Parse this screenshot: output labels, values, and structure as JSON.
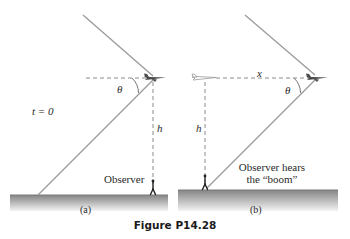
{
  "figure": {
    "caption": "Figure P14.28",
    "colors": {
      "line": "#9a9a9a",
      "dashed": "#8a8a8a",
      "ground_top": "#8c8c8c",
      "ground_bottom": "#f2f2f2",
      "text": "#2a2a2a"
    },
    "panel_a": {
      "label": "(a)",
      "time_label": "t = 0",
      "angle_label": "θ",
      "height_label": "h",
      "observer_label": "Observer"
    },
    "panel_b": {
      "label": "(b)",
      "distance_label": "x",
      "angle_label": "θ",
      "height_label": "h",
      "observer_label_line1": "Observer hears",
      "observer_label_line2": "the “boom”"
    }
  }
}
